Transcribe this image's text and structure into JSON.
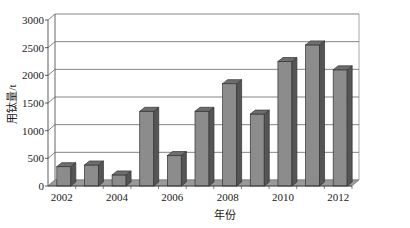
{
  "chart_data": {
    "type": "bar",
    "title": "",
    "xlabel": "年份",
    "ylabel": "用钛量/t",
    "categories": [
      "2002",
      "2003",
      "2004",
      "2005",
      "2006",
      "2007",
      "2008",
      "2009",
      "2010",
      "2011",
      "2012"
    ],
    "x_tick_labels": [
      "2002",
      "2004",
      "2006",
      "2008",
      "2010",
      "2012"
    ],
    "values": [
      350,
      380,
      200,
      1350,
      550,
      1350,
      1850,
      1300,
      2250,
      2550,
      2100
    ],
    "y_ticks": [
      0,
      500,
      1000,
      1500,
      2000,
      2500,
      3000
    ],
    "ylim": [
      0,
      3000
    ],
    "grid": true,
    "legend": null,
    "style": "3d-column",
    "colors": {
      "bar_front": "#8c8c8c",
      "bar_side": "#555555",
      "bar_top": "#6e6e6e",
      "floor": "#9a9a9a",
      "grid": "#666666"
    }
  }
}
